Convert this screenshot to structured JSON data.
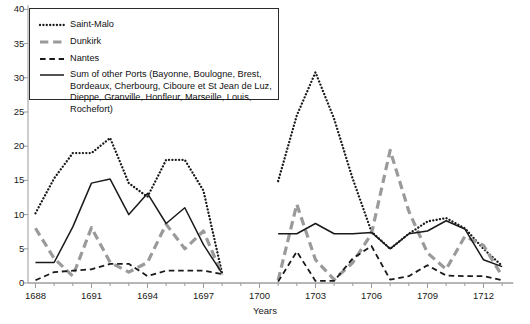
{
  "chart_data": {
    "type": "line",
    "title": "",
    "xlabel": "Years",
    "ylabel": "",
    "xlim": [
      1687.6,
      1713.6
    ],
    "ylim": [
      0,
      40
    ],
    "x_ticks": [
      1688,
      1691,
      1694,
      1697,
      1700,
      1703,
      1706,
      1709,
      1712
    ],
    "y_ticks": [
      0,
      5,
      10,
      15,
      20,
      25,
      30,
      35,
      40
    ],
    "grid": false,
    "legend_position": "top-left",
    "note": "Two data blocks separated by a gap of missing years (approx. 1698-1700).",
    "series": [
      {
        "name": "Saint-Malo",
        "style": "dotted",
        "color": "#1a1a1a",
        "segments": [
          {
            "x": [
              1688,
              1689,
              1690,
              1691,
              1692,
              1693,
              1694,
              1695,
              1696,
              1697,
              1698
            ],
            "y": [
              10.2,
              15.3,
              19.0,
              19.0,
              21.2,
              14.6,
              12.6,
              18.0,
              18.0,
              13.5,
              1.4
            ]
          },
          {
            "x": [
              1701,
              1702,
              1703,
              1704,
              1705,
              1706,
              1707,
              1708,
              1709,
              1710,
              1711,
              1712,
              1713
            ],
            "y": [
              14.9,
              24.5,
              30.8,
              24.0,
              15.2,
              7.5,
              5.0,
              7.2,
              9.0,
              9.5,
              8.0,
              5.0,
              2.5
            ]
          }
        ]
      },
      {
        "name": "Dunkirk",
        "style": "solid-thick-gray",
        "color": "#9a9a9a",
        "segments": [
          {
            "x": [
              1688,
              1689,
              1690,
              1691,
              1692,
              1693,
              1694,
              1695,
              1696,
              1697,
              1698
            ],
            "y": [
              8.0,
              3.6,
              1.0,
              8.1,
              3.0,
              1.6,
              3.0,
              8.6,
              5.0,
              7.6,
              1.2
            ]
          },
          {
            "x": [
              1701,
              1702,
              1703,
              1704,
              1705,
              1706,
              1707,
              1708,
              1709,
              1710,
              1711,
              1712,
              1713
            ],
            "y": [
              0.4,
              11.5,
              3.4,
              0.5,
              3.0,
              7.2,
              19.4,
              10.5,
              4.4,
              2.0,
              6.8,
              5.5,
              1.0
            ]
          }
        ]
      },
      {
        "name": "Nantes",
        "style": "dashed",
        "color": "#1a1a1a",
        "segments": [
          {
            "x": [
              1688,
              1689,
              1690,
              1691,
              1692,
              1693,
              1694,
              1695,
              1696,
              1697,
              1698
            ],
            "y": [
              0.4,
              1.6,
              1.8,
              2.0,
              2.8,
              2.8,
              1.0,
              1.8,
              1.8,
              1.8,
              1.3
            ]
          },
          {
            "x": [
              1701,
              1702,
              1703,
              1704,
              1705,
              1706,
              1707,
              1708,
              1709,
              1710,
              1711,
              1712,
              1713
            ],
            "y": [
              0.2,
              4.6,
              0.3,
              0.3,
              3.6,
              5.4,
              0.5,
              1.0,
              2.6,
              1.1,
              1.0,
              1.0,
              0.4
            ]
          }
        ]
      },
      {
        "name": "Sum of other Ports",
        "style": "solid",
        "color": "#1a1a1a",
        "segments": [
          {
            "x": [
              1688,
              1689,
              1690,
              1691,
              1692,
              1693,
              1694,
              1695,
              1696,
              1697,
              1698
            ],
            "y": [
              3.0,
              3.0,
              8.2,
              14.6,
              15.2,
              10.0,
              13.1,
              8.7,
              11.0,
              5.6,
              1.4
            ]
          },
          {
            "x": [
              1701,
              1702,
              1703,
              1704,
              1705,
              1706,
              1707,
              1708,
              1709,
              1710,
              1711,
              1712,
              1713
            ],
            "y": [
              7.2,
              7.2,
              8.7,
              7.2,
              7.2,
              7.4,
              5.0,
              7.2,
              7.6,
              9.1,
              7.9,
              3.4,
              2.4
            ]
          }
        ]
      }
    ]
  },
  "axes": {
    "x_title": "Years",
    "x_tick_labels": [
      "1688",
      "1691",
      "1694",
      "1697",
      "1700",
      "1703",
      "1706",
      "1709",
      "1712"
    ],
    "y_tick_labels": [
      "0",
      "5",
      "10",
      "15",
      "20",
      "25",
      "30",
      "35",
      "40"
    ]
  },
  "legend": {
    "items": [
      {
        "label": "Saint-Malo",
        "style": "dotted",
        "color": "#1a1a1a"
      },
      {
        "label": "Dunkirk",
        "style": "solid-thick-gray",
        "color": "#9a9a9a"
      },
      {
        "label": "Nantes",
        "style": "dashed",
        "color": "#1a1a1a"
      },
      {
        "label": "Sum of other Ports (Bayonne, Boulogne, Brest,\nBordeaux, Cherbourg, Ciboure et St Jean de Luz,\nDieppe, Granville, Honfleur, Marseille, Louis, Rochefort)",
        "style": "solid",
        "color": "#1a1a1a"
      }
    ]
  }
}
